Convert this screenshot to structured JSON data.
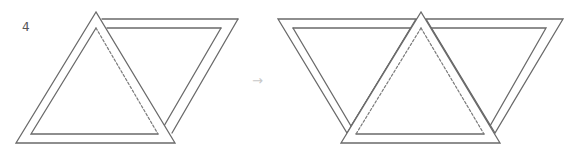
{
  "step_number": "4",
  "arrow_glyph": "→",
  "colors": {
    "line": "#6a6a6a",
    "dashed": "#7a7a7a",
    "arrow": "#c8c8c8",
    "background": "#ffffff"
  },
  "figures": {
    "before": {
      "description": "Triangle folded over a rhombus-shaped strip, dashed fold line on triangle's inner right edge"
    },
    "after": {
      "description": "Central upright triangle overlapping two inverted triangles, dashed inner outline on central triangle"
    }
  }
}
